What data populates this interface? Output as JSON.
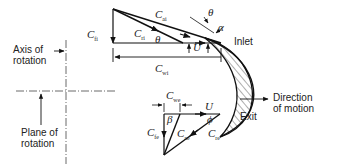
{
  "diagram": {
    "labels": {
      "axis_of_rotation": [
        "Axis of",
        "rotation"
      ],
      "plane_of_rotation": [
        "Plane of",
        "rotation"
      ],
      "inlet": "Inlet",
      "exit": "Exit",
      "direction_of_motion": [
        "Direction",
        "of motion"
      ]
    },
    "inlet_triangle": {
      "C_fi": {
        "sym": "C",
        "sub": "fi"
      },
      "C_ai": {
        "sym": "C",
        "sub": "ai"
      },
      "C_ri": {
        "sym": "C",
        "sub": "ri"
      },
      "C_wi": {
        "sym": "C",
        "sub": "wi"
      },
      "theta": "θ",
      "theta_top": "θ",
      "alpha": "α",
      "U": "U"
    },
    "exit_triangle": {
      "C_we": {
        "sym": "C",
        "sub": "we"
      },
      "C_fe": {
        "sym": "C",
        "sub": "fe"
      },
      "C_ae": {
        "sym": "C",
        "sub": "ae"
      },
      "C_re": {
        "sym": "C",
        "sub": "re"
      },
      "beta": "β",
      "phi": "ϕ",
      "U": "U"
    }
  }
}
